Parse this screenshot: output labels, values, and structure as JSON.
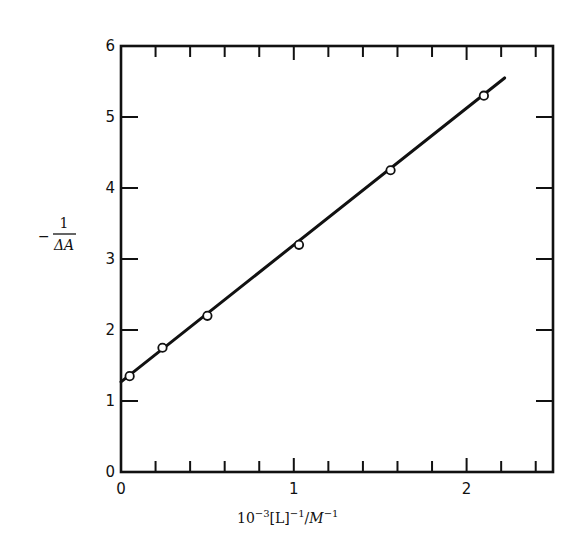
{
  "chart_data": {
    "type": "scatter",
    "title": "",
    "xlabel": "10^-3[L]^-1/M^-1",
    "xlabel_parts": {
      "base": "10",
      "exp1": "−3",
      "mid": "[L]",
      "exp2": "−1",
      "slash": "/",
      "unit": "M",
      "exp3": "−1"
    },
    "ylabel": "-1/ΔA",
    "ylabel_parts": {
      "minus": "−",
      "numerator": "1",
      "denominator": "ΔA"
    },
    "xlim": [
      0,
      2.5
    ],
    "ylim": [
      0,
      6
    ],
    "x_ticks": [
      0,
      1,
      2
    ],
    "x_tick_labels": [
      "0",
      "1",
      "2"
    ],
    "x_minor_step": 0.2,
    "y_ticks": [
      0,
      1,
      2,
      3,
      4,
      5,
      6
    ],
    "y_tick_labels": [
      "0",
      "1",
      "2",
      "3",
      "4",
      "5",
      "6"
    ],
    "grid": false,
    "legend": null,
    "series": [
      {
        "name": "data",
        "marker": "open-circle",
        "x": [
          0.05,
          0.24,
          0.5,
          1.03,
          1.56,
          2.1
        ],
        "y": [
          1.35,
          1.75,
          2.2,
          3.2,
          4.25,
          5.3
        ]
      },
      {
        "name": "linear fit",
        "style": "line",
        "x": [
          0.0,
          2.22
        ],
        "y": [
          1.27,
          5.55
        ]
      }
    ]
  }
}
